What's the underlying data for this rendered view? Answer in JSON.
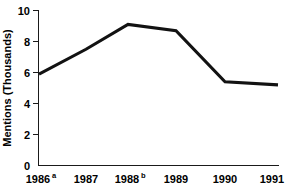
{
  "chart_data": {
    "type": "line",
    "title": "",
    "subtitle": "",
    "xlabel": "",
    "ylabel": "Mentions (Thousands)",
    "categories": [
      "1986",
      "1987",
      "1988",
      "1989",
      "1990",
      "1991"
    ],
    "category_superscripts": [
      "a",
      "",
      "b",
      "",
      "",
      ""
    ],
    "tick_labels_x": [
      "1986a",
      "1987",
      "1988b",
      "1989",
      "1990",
      "1991"
    ],
    "values": [
      5.9,
      7.5,
      9.1,
      8.7,
      5.4,
      5.2
    ],
    "series": [
      {
        "name": "Mentions",
        "values": [
          5.9,
          7.5,
          9.1,
          8.7,
          5.4,
          5.2
        ]
      }
    ],
    "ylim": [
      0,
      10
    ],
    "yticks": [
      0,
      2,
      4,
      6,
      8,
      10
    ],
    "ytick_labels": [
      "0",
      "2",
      "4",
      "6",
      "8",
      "10"
    ],
    "grid": false,
    "legend": false,
    "legend_position": "none",
    "line_color": "#121212",
    "background_color": "#ffffff",
    "axis_color": "#1a1a1a"
  },
  "axis": {
    "y_title": "Mentions (Thousands)"
  },
  "yticks": [
    {
      "label": "10",
      "value": 10
    },
    {
      "label": "8",
      "value": 8
    },
    {
      "label": "6",
      "value": 6
    },
    {
      "label": "4",
      "value": 4
    },
    {
      "label": "2",
      "value": 2
    },
    {
      "label": "0",
      "value": 0
    }
  ],
  "xticks": [
    {
      "label": "1986",
      "sup": "a"
    },
    {
      "label": "1987",
      "sup": ""
    },
    {
      "label": "1988",
      "sup": "b"
    },
    {
      "label": "1989",
      "sup": ""
    },
    {
      "label": "1990",
      "sup": ""
    },
    {
      "label": "1991",
      "sup": ""
    }
  ]
}
